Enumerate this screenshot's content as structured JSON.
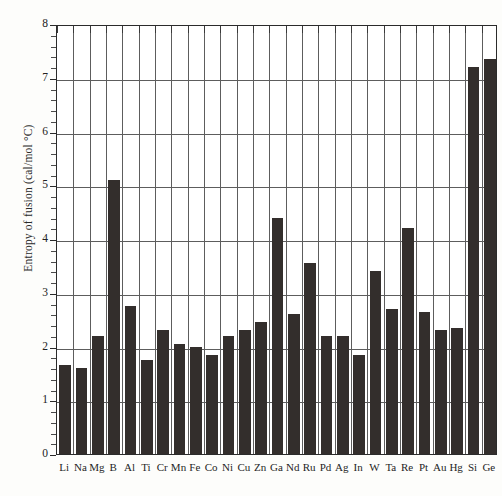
{
  "chart_data": {
    "type": "bar",
    "title": "",
    "xlabel": "",
    "ylabel": "Entropy of fusion (cal/mol °C)",
    "ylim": [
      0,
      8
    ],
    "ytick_labels": [
      "0",
      "1",
      "2",
      "3",
      "4",
      "5",
      "6",
      "7",
      "8"
    ],
    "ytick_values": [
      0,
      1,
      2,
      3,
      4,
      5,
      6,
      7,
      8
    ],
    "grid": true,
    "legend": "none",
    "bar_color": "#332e2c",
    "categories": [
      "Li",
      "Na",
      "Mg",
      "B",
      "Al",
      "Ti",
      "Cr",
      "Mn",
      "Fe",
      "Co",
      "Ni",
      "Cu",
      "Zn",
      "Ga",
      "Nd",
      "Ru",
      "Pd",
      "Ag",
      "In",
      "W",
      "Ta",
      "Re",
      "Pt",
      "Au",
      "Hg",
      "Si",
      "Ge"
    ],
    "values": [
      1.65,
      1.6,
      2.2,
      5.1,
      2.75,
      1.75,
      2.3,
      2.05,
      2.0,
      1.85,
      2.2,
      2.3,
      2.45,
      4.4,
      2.6,
      3.55,
      2.2,
      2.2,
      1.85,
      3.4,
      2.7,
      4.2,
      2.65,
      2.3,
      2.35,
      7.2,
      7.35
    ]
  }
}
